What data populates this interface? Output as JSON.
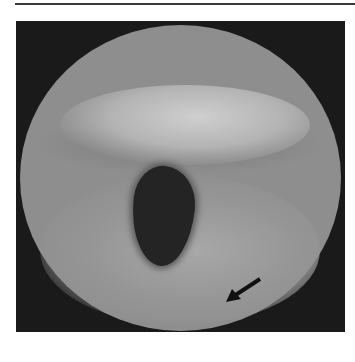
{
  "image": {
    "description": "Grayscale circular endoscopic view of the larynx with a dark glottic opening at center and a black arrow pointing toward tissue at lower right",
    "annotation": {
      "type": "arrow",
      "color": "#111111",
      "direction": "down-left"
    },
    "colors": {
      "background": "#1a1a1a",
      "tissue": "#8e8e8e",
      "highlight": "#cfcfcf",
      "lumen": "#242424",
      "rule": "#3a3a3a"
    }
  }
}
